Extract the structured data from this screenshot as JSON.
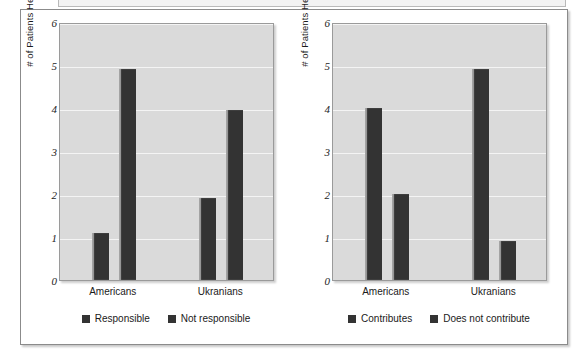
{
  "figure": {
    "panel_count": 2
  },
  "chart_data": [
    {
      "type": "bar",
      "title": "",
      "xlabel": "",
      "ylabel": "# of Patients Helped",
      "ylim": [
        0,
        6
      ],
      "yticks": [
        6,
        5,
        4,
        3,
        2,
        1,
        0
      ],
      "grid": true,
      "legend_position": "bottom",
      "categories": [
        "Americans",
        "Ukranians"
      ],
      "series": [
        {
          "name": "Responsible",
          "values": [
            1.1,
            1.9
          ],
          "color": "#333333"
        },
        {
          "name": "Not responsible",
          "values": [
            4.9,
            3.95
          ],
          "color": "#333333"
        }
      ]
    },
    {
      "type": "bar",
      "title": "",
      "xlabel": "",
      "ylabel": "# of Patients Helped",
      "ylim": [
        0,
        6
      ],
      "yticks": [
        6,
        5,
        4,
        3,
        2,
        1,
        0
      ],
      "grid": true,
      "legend_position": "bottom",
      "categories": [
        "Americans",
        "Ukranians"
      ],
      "series": [
        {
          "name": "Contributes",
          "values": [
            4.0,
            4.9
          ],
          "color": "#333333"
        },
        {
          "name": "Does not contribute",
          "values": [
            2.0,
            0.9
          ],
          "color": "#333333"
        }
      ]
    }
  ]
}
